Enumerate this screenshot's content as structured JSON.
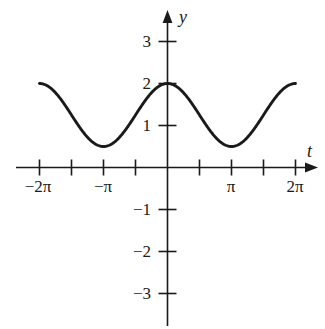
{
  "chart_data": {
    "type": "line",
    "title": "",
    "xlabel": "t",
    "ylabel": "y",
    "grid": false,
    "legend": "none",
    "xlim": [
      -7.2,
      7.4
    ],
    "ylim": [
      -3.6,
      3.6
    ],
    "function": "y = 1.25 + 0.75 cos(t)",
    "amplitude": 0.75,
    "midline": 1.25,
    "period": "2π",
    "maximum": 2,
    "minimum": 0.5,
    "x_domain": [
      "-2π",
      "2π"
    ],
    "x_tick_values": [
      -6.2832,
      -4.7124,
      -3.1416,
      -1.5708,
      1.5708,
      3.1416,
      4.7124,
      6.2832
    ],
    "x_tick_labels": [
      "−2π",
      "",
      "−π",
      "",
      "",
      "π",
      "",
      "2π"
    ],
    "y_tick_values": [
      3,
      2,
      1,
      -1,
      -2,
      -3
    ],
    "y_tick_labels": [
      "3",
      "2",
      "1",
      "−1",
      "−2",
      "−3"
    ],
    "key_points": [
      {
        "t": "−2π",
        "y": 2
      },
      {
        "t": "−π",
        "y": 0.5
      },
      {
        "t": "0",
        "y": 2
      },
      {
        "t": "π",
        "y": 0.5
      },
      {
        "t": "2π",
        "y": 2
      }
    ],
    "curve_points_t": [
      -6.2832,
      -5.8905,
      -5.4978,
      -5.1051,
      -4.7124,
      -4.3197,
      -3.927,
      -3.5343,
      -3.1416,
      -2.7489,
      -2.3562,
      -1.9635,
      -1.5708,
      -1.1781,
      -0.7854,
      -0.3927,
      0,
      0.3927,
      0.7854,
      1.1781,
      1.5708,
      1.9635,
      2.3562,
      2.7489,
      3.1416,
      3.5343,
      3.927,
      4.3197,
      4.7124,
      5.1051,
      5.4978,
      5.8905,
      6.2832
    ],
    "curve_points_y": [
      2.0,
      1.943,
      1.78,
      1.537,
      1.25,
      0.963,
      0.72,
      0.557,
      0.5,
      0.557,
      0.72,
      0.963,
      1.25,
      1.537,
      1.78,
      1.943,
      2.0,
      1.943,
      1.78,
      1.537,
      1.25,
      0.963,
      0.72,
      0.557,
      0.5,
      0.557,
      0.72,
      0.963,
      1.25,
      1.537,
      1.78,
      1.943,
      2.0
    ],
    "colors": {
      "curve": "#1a1a1a",
      "axis": "#1a1a1a",
      "background": "#ffffff"
    }
  }
}
